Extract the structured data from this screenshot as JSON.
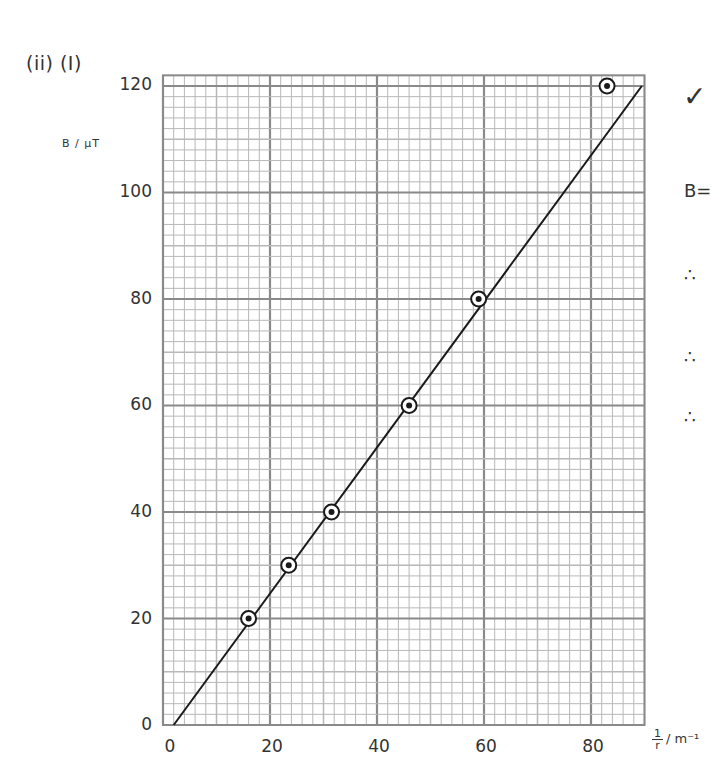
{
  "annotations": {
    "part_label": "(ii) (I)",
    "check_mark": "✓",
    "side_equation": "B=",
    "therefore_symbols": [
      "∴",
      "∴",
      "∴"
    ]
  },
  "axes": {
    "y_unit_label": "B / μT",
    "x_unit_label_numerator": "1",
    "x_unit_label_denominator": "r",
    "x_unit_label_suffix": "/ m⁻¹",
    "y_ticks": [
      "0",
      "20",
      "40",
      "60",
      "80",
      "100",
      "120"
    ],
    "x_ticks": [
      "0",
      "20",
      "40",
      "60",
      "80"
    ]
  },
  "chart_data": {
    "type": "scatter",
    "title": "",
    "xlabel": "1/r / m⁻¹",
    "ylabel": "B / μT",
    "xlim": [
      0,
      90
    ],
    "ylim": [
      0,
      122
    ],
    "x_ticks": [
      0,
      20,
      40,
      60,
      80
    ],
    "y_ticks": [
      0,
      20,
      40,
      60,
      80,
      100,
      120
    ],
    "grid": true,
    "grid_minor_step": 2,
    "grid_major_step": 20,
    "series": [
      {
        "name": "measured points",
        "marker": "circled dot",
        "x": [
          16,
          23.5,
          31.5,
          46,
          59,
          83
        ],
        "y": [
          20,
          30,
          40,
          60,
          80,
          120
        ]
      },
      {
        "name": "best-fit line",
        "type": "line",
        "x": [
          2,
          89.5
        ],
        "y": [
          0,
          120
        ]
      }
    ],
    "legend": null
  },
  "colors": {
    "grid_minor": "#b8b8b8",
    "grid_major": "#8a8a8a",
    "ink": "#1a1a1a",
    "background": "#ffffff"
  }
}
